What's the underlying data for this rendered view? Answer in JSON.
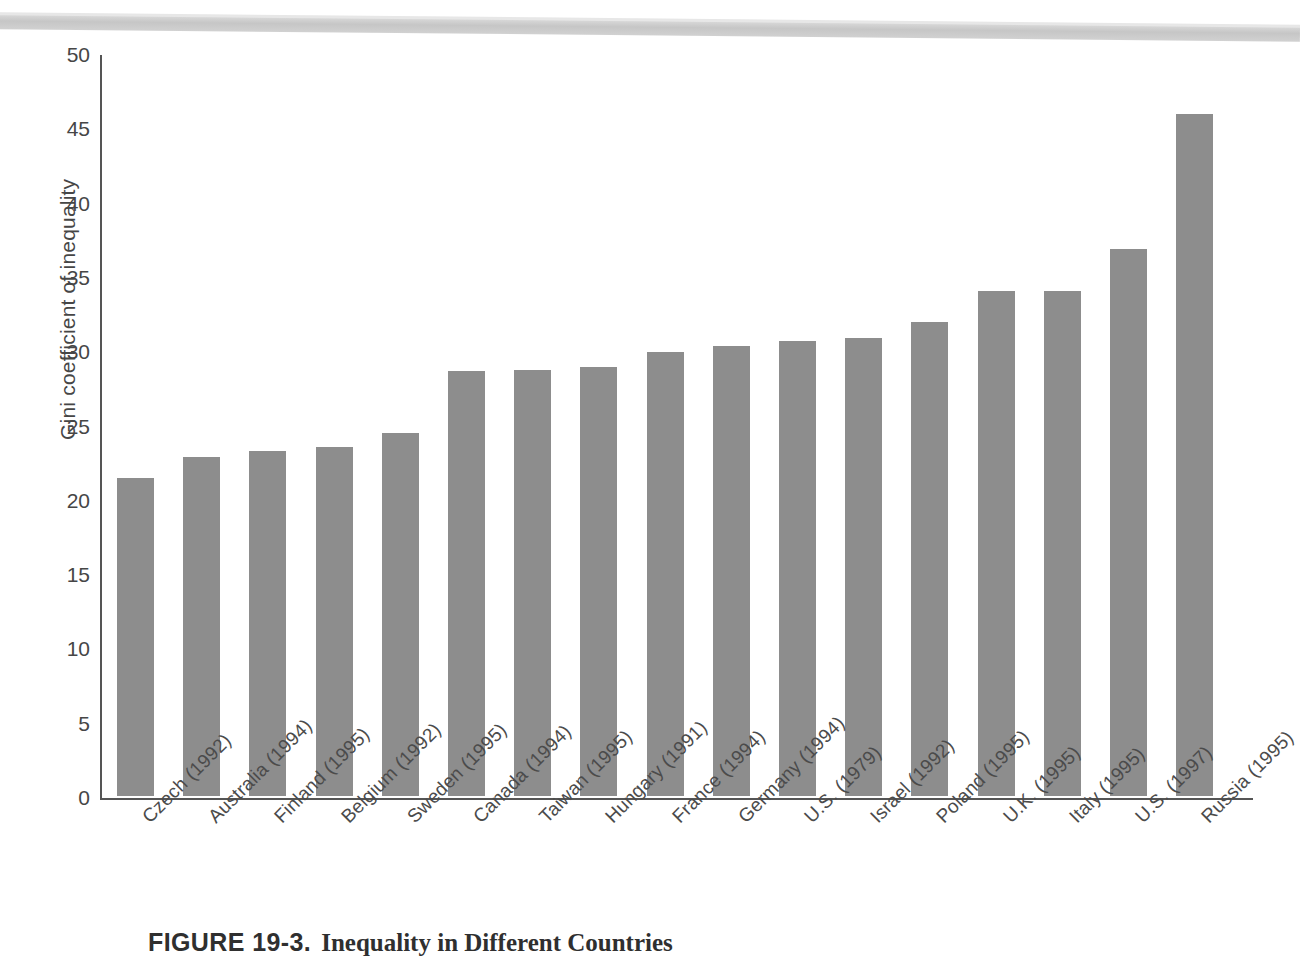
{
  "figure": {
    "number_label": "FIGURE 19-3.",
    "caption_text": "Inequality in Different Countries"
  },
  "axes": {
    "y_title": "Gini coefficient of inequality",
    "x_title": "",
    "y_ticks": [
      "0",
      "5",
      "10",
      "15",
      "20",
      "25",
      "30",
      "35",
      "40",
      "45",
      "50"
    ]
  },
  "colors": {
    "bar_fill": "#8d8d8d",
    "axis": "#555555",
    "text": "#464646",
    "scan_band": "#c4c4c4"
  },
  "chart_data": {
    "type": "bar",
    "title": "Inequality in Different Countries",
    "xlabel": "",
    "ylabel": "Gini coefficient of inequality",
    "ylim": [
      0,
      50
    ],
    "ytick_step": 5,
    "grid": false,
    "legend": null,
    "categories": [
      "Czech (1992)",
      "Australia (1994)",
      "Finland (1995)",
      "Belgium (1992)",
      "Sweden (1995)",
      "Canada (1994)",
      "Taiwan (1995)",
      "Hungary (1991)",
      "France (1994)",
      "Germany (1994)",
      "U.S. (1979)",
      "Israel (1992)",
      "Poland (1995)",
      "U.K. (1995)",
      "Italy (1995)",
      "U.S. (1997)",
      "Russia (1995)"
    ],
    "values": [
      21.4,
      22.8,
      23.2,
      23.5,
      24.4,
      28.6,
      28.7,
      28.9,
      29.9,
      30.3,
      30.6,
      30.8,
      31.9,
      34.0,
      34.0,
      36.8,
      45.9
    ]
  }
}
